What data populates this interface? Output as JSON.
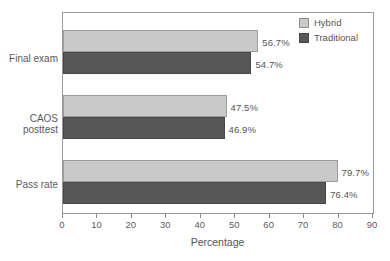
{
  "chart_data": {
    "type": "bar",
    "orientation": "horizontal",
    "title": "",
    "subtitle": "",
    "xlabel": "Percentage",
    "ylabel": "",
    "xlim": [
      0,
      90
    ],
    "xticks": [
      0,
      10,
      20,
      30,
      40,
      50,
      60,
      70,
      80,
      90
    ],
    "xtick_labels": [
      "0",
      "10",
      "20",
      "30",
      "40",
      "50",
      "60",
      "70",
      "80",
      "90"
    ],
    "grid": false,
    "legend_position": "top-right",
    "categories": [
      "Final exam",
      "CAOS posttest",
      "Pass rate"
    ],
    "category_labels": [
      "Final exam",
      "CAOS\nposttest",
      "Pass rate"
    ],
    "series": [
      {
        "name": "Hybrid",
        "color": "#c9c9c9",
        "values": [
          56.7,
          47.5,
          79.7
        ],
        "data_labels": [
          "56.7%",
          "47.5%",
          "79.7%"
        ]
      },
      {
        "name": "Traditional",
        "color": "#575757",
        "values": [
          54.7,
          46.9,
          76.4
        ],
        "data_labels": [
          "54.7%",
          "46.9%",
          "76.4%"
        ]
      }
    ]
  },
  "legend": {
    "items": [
      {
        "label": "Hybrid",
        "color": "#c9c9c9"
      },
      {
        "label": "Traditional",
        "color": "#575757"
      }
    ]
  },
  "axis": {
    "x_title": "Percentage",
    "tick_labels": [
      "0",
      "10",
      "20",
      "30",
      "40",
      "50",
      "60",
      "70",
      "80",
      "90"
    ]
  },
  "categories": {
    "line_0a": "Final exam",
    "line_1a": "CAOS",
    "line_1b": "posttest",
    "line_2a": "Pass rate"
  },
  "values": {
    "final_hybrid": "56.7%",
    "final_traditional": "54.7%",
    "caos_hybrid": "47.5%",
    "caos_traditional": "46.9%",
    "pass_hybrid": "79.7%",
    "pass_traditional": "76.4%"
  },
  "colors": {
    "hybrid": "#c9c9c9",
    "traditional": "#575757",
    "frame": "#9a9a9a",
    "text": "#555555",
    "background": "#ffffff"
  }
}
